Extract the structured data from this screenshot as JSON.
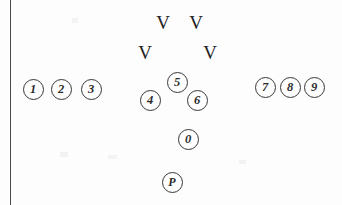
{
  "diagram": {
    "type": "football-formation",
    "canvas": {
      "width": 342,
      "height": 205,
      "background": "#fdfdfd"
    },
    "ink_color": "#2e2e2e",
    "sideline": {
      "name": "left-sideline",
      "x": 10,
      "color": "#3a3a3a"
    },
    "players": [
      {
        "id": "p1",
        "label": "1",
        "x": 33,
        "y": 89,
        "group": "left-receivers"
      },
      {
        "id": "p2",
        "label": "2",
        "x": 61,
        "y": 89,
        "group": "left-receivers"
      },
      {
        "id": "p3",
        "label": "3",
        "x": 91,
        "y": 89,
        "group": "left-receivers"
      },
      {
        "id": "p4",
        "label": "4",
        "x": 150,
        "y": 100,
        "group": "center-backfield"
      },
      {
        "id": "p5",
        "label": "5",
        "x": 177,
        "y": 82,
        "group": "center-backfield"
      },
      {
        "id": "p6",
        "label": "6",
        "x": 197,
        "y": 100,
        "group": "center-backfield"
      },
      {
        "id": "p7",
        "label": "7",
        "x": 265,
        "y": 87,
        "group": "right-receivers"
      },
      {
        "id": "p8",
        "label": "8",
        "x": 290,
        "y": 87,
        "group": "right-receivers"
      },
      {
        "id": "p9",
        "label": "9",
        "x": 314,
        "y": 87,
        "group": "right-receivers"
      },
      {
        "id": "p0",
        "label": "0",
        "x": 188,
        "y": 139,
        "group": "deep"
      },
      {
        "id": "pP",
        "label": "P",
        "x": 172,
        "y": 182,
        "group": "deep"
      }
    ],
    "defenders": [
      {
        "id": "v1",
        "label": "V",
        "x": 163,
        "y": 22
      },
      {
        "id": "v2",
        "label": "V",
        "x": 196,
        "y": 22
      },
      {
        "id": "v3",
        "label": "V",
        "x": 145,
        "y": 52
      },
      {
        "id": "v4",
        "label": "V",
        "x": 210,
        "y": 52
      }
    ]
  }
}
